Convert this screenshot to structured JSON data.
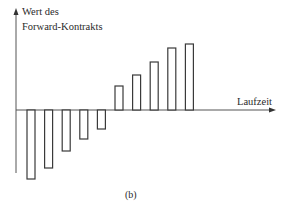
{
  "chart_data": {
    "type": "bar",
    "title": "",
    "caption": "(b)",
    "ylabel_lines": [
      "Wert des",
      "Forward-Kontrakts"
    ],
    "xlabel": "Laufzeit",
    "categories": [
      "1",
      "2",
      "3",
      "4",
      "5",
      "6",
      "7",
      "8",
      "9",
      "10"
    ],
    "values": [
      -69,
      -58,
      -41,
      -29,
      -19,
      24,
      35,
      48,
      62,
      66
    ],
    "units_note": "relative heights in pixels; no numeric ticks shown",
    "axis_ticks": "none",
    "grid": false,
    "legend": null,
    "bar_style": "outlined, white fill",
    "colors": {
      "axis": "#555555",
      "bar_stroke": "#3a3a3a",
      "bar_fill": "#ffffff",
      "text": "#2a2a2a"
    }
  }
}
